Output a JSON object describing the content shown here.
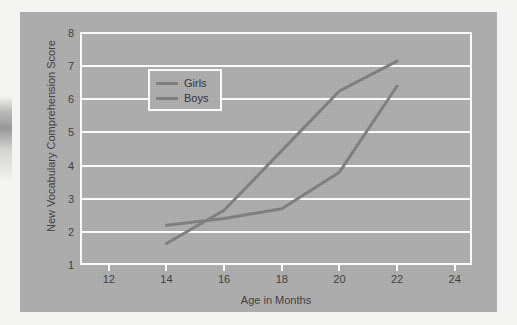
{
  "figure": {
    "background_color": "#acacac",
    "gridline_color": "#ffffff",
    "line_color": "#7d7d7d",
    "text_color": "#3b3b3b"
  },
  "legend": {
    "position": "top-left-inside",
    "entries": [
      {
        "label": "Girls"
      },
      {
        "label": "Boys"
      }
    ]
  },
  "chart_data": {
    "type": "line",
    "title": "",
    "xlabel": "Age in Months",
    "ylabel": "New Vocabulary Comprehension Score",
    "xlim": [
      11,
      24.6
    ],
    "ylim": [
      1,
      8
    ],
    "xticks": [
      12,
      14,
      16,
      18,
      20,
      22,
      24
    ],
    "xtick_labels": [
      "12",
      "14",
      "16",
      "18",
      "20",
      "22",
      "24"
    ],
    "yticks": [
      1,
      2,
      3,
      4,
      5,
      6,
      7,
      8
    ],
    "ytick_labels": [
      "1",
      "2",
      "3",
      "4",
      "5",
      "6",
      "7",
      "8"
    ],
    "grid": "horizontal",
    "legend_position": "upper left",
    "x": [
      14,
      16,
      18,
      20,
      22
    ],
    "series": [
      {
        "name": "Girls",
        "values": [
          2.2,
          2.4,
          2.7,
          3.8,
          6.4
        ]
      },
      {
        "name": "Boys",
        "values": [
          1.65,
          2.65,
          4.45,
          6.25,
          7.15
        ]
      }
    ]
  }
}
